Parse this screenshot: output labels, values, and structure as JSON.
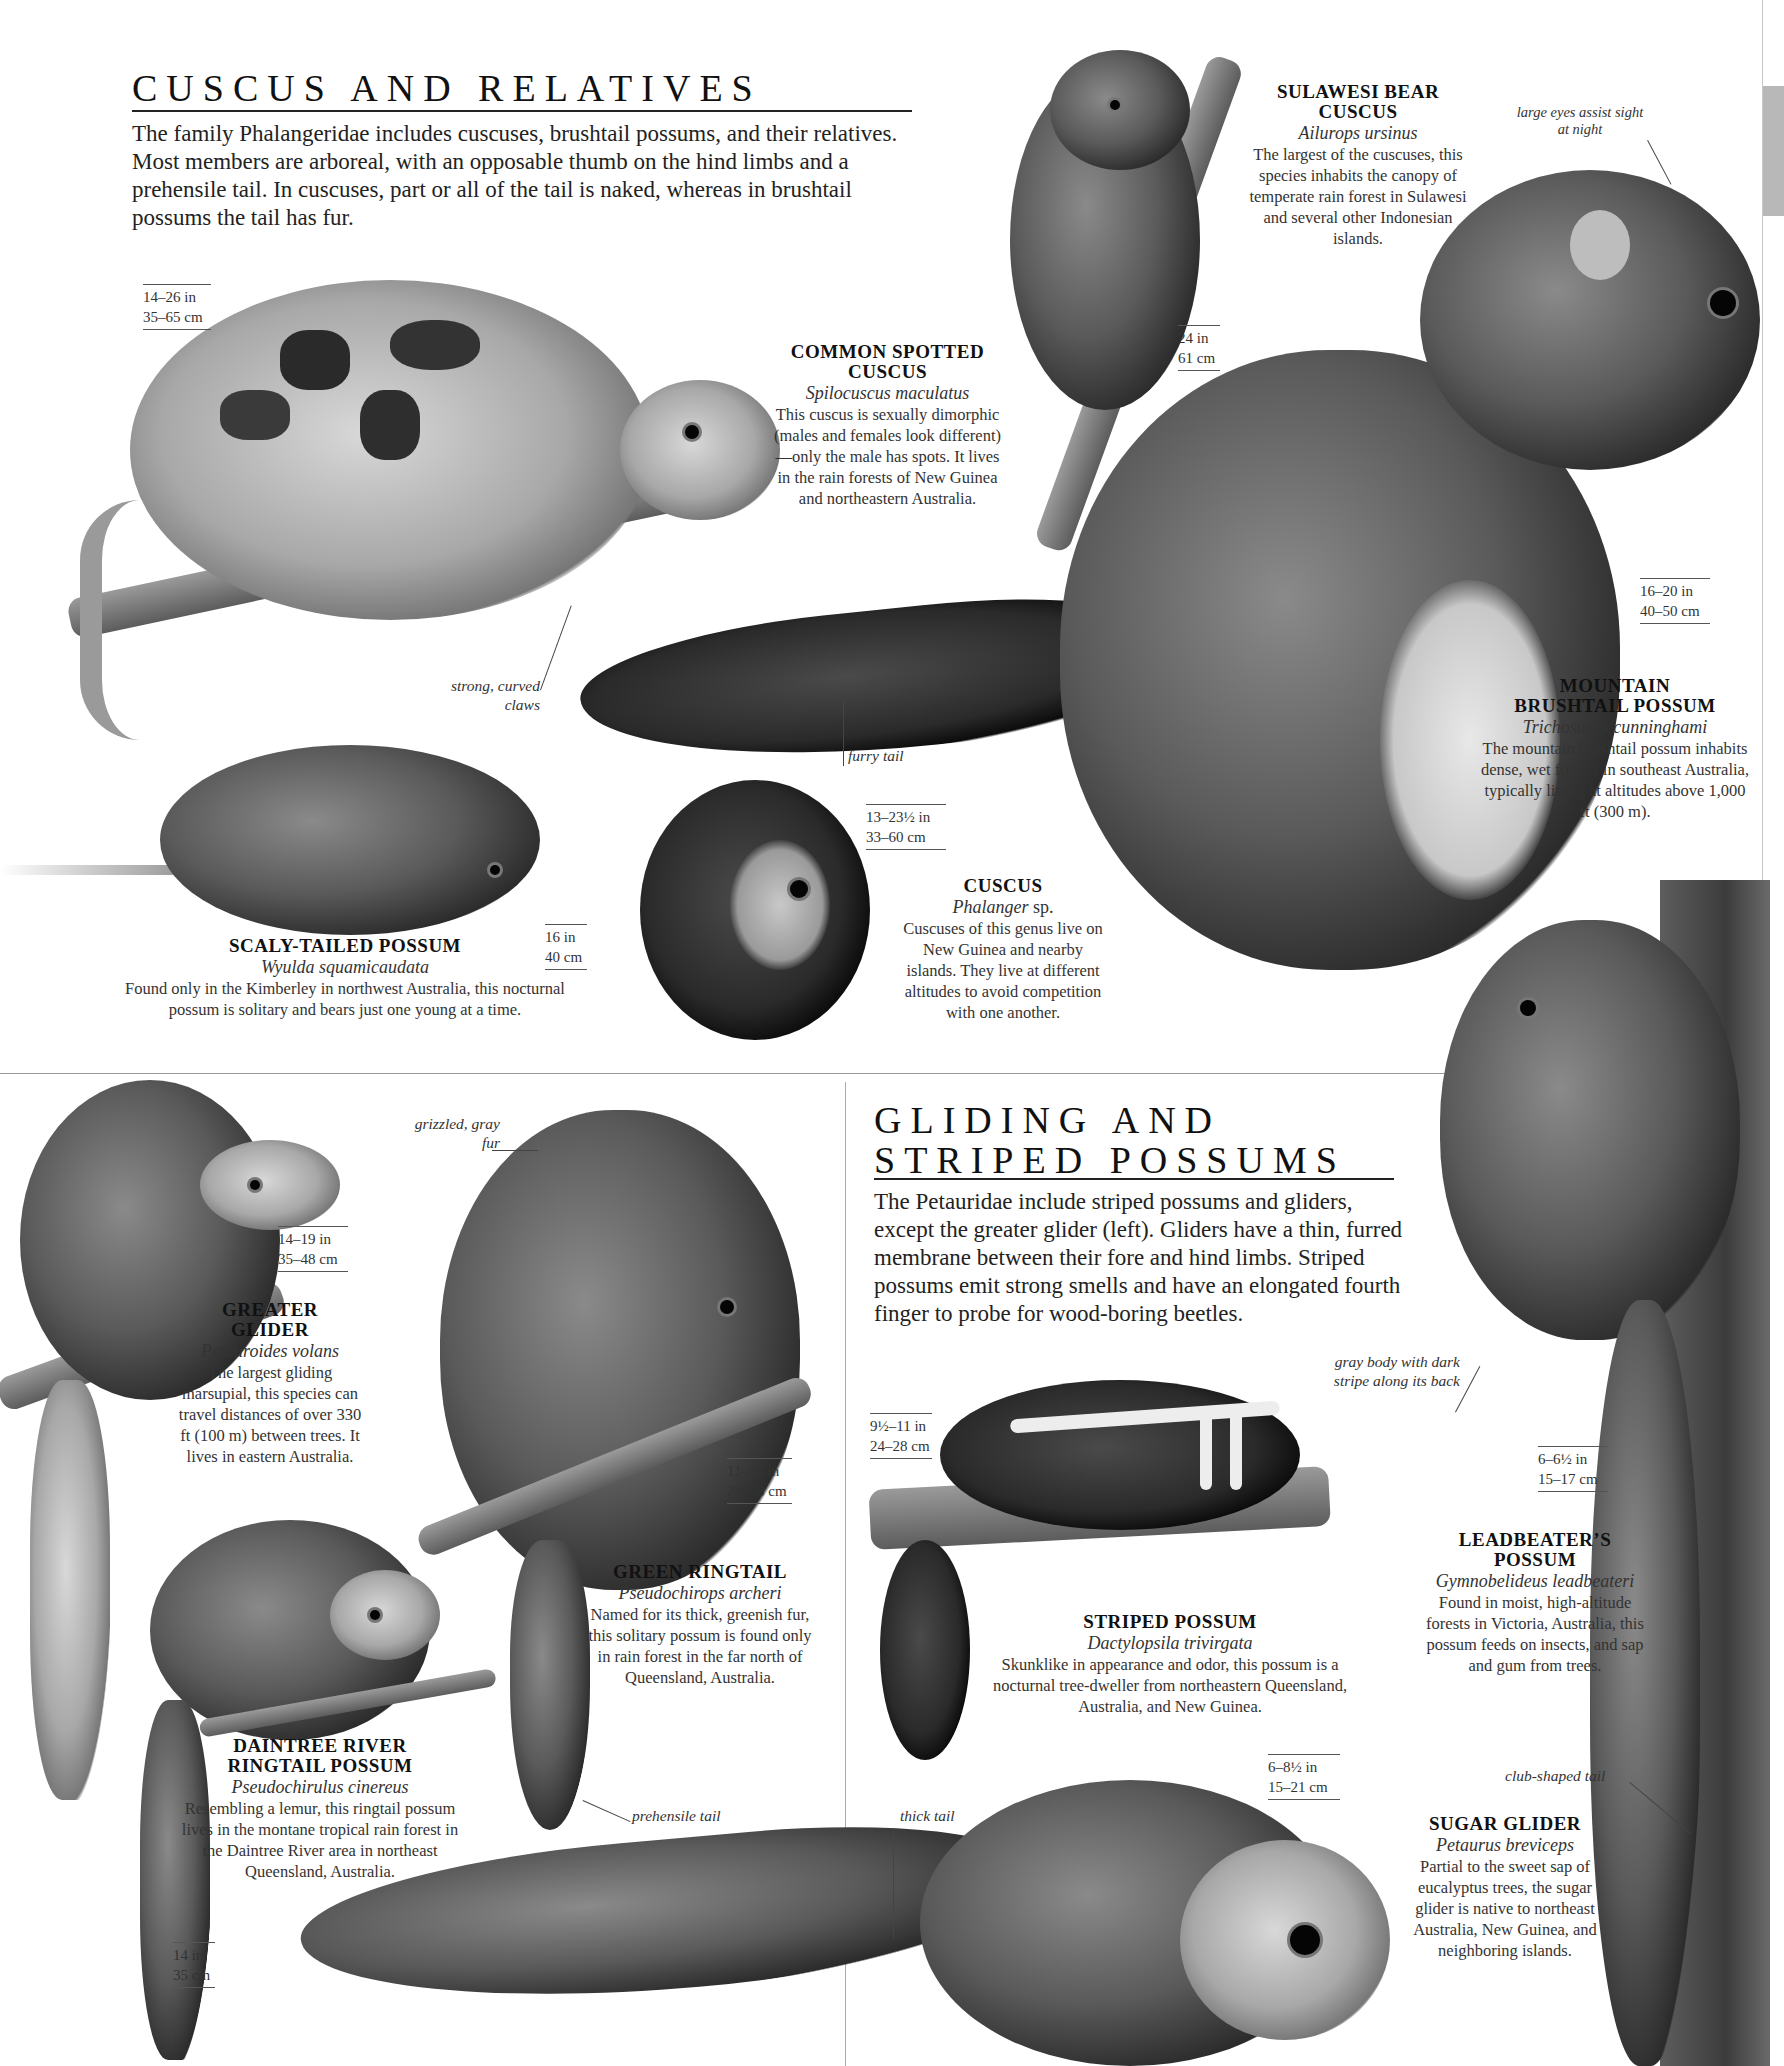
{
  "sections": {
    "cuscus": {
      "title": "CUSCUS AND RELATIVES",
      "intro": "The family Phalangeridae includes cuscuses, brushtail possums, and their relatives. Most members are arboreal, with an opposable thumb on the hind limbs and a prehensile tail. In cuscuses, part or all of the tail is naked, whereas in brushtail possums the tail has fur."
    },
    "gliding": {
      "title_line1": "GLIDING AND",
      "title_line2": "STRIPED POSSUMS",
      "intro": "The Petauridae include striped possums and gliders, except the greater glider (left). Gliders have a thin, furred membrane between their fore and hind limbs. Striped possums emit strong smells and have an elongated fourth finger to probe for wood-boring beetles."
    }
  },
  "species": [
    {
      "id": "sulawesi-bear-cuscus",
      "name_line1": "SULAWESI BEAR",
      "name_line2": "CUSCUS",
      "latin": "Ailurops ursinus",
      "description": "The largest of the cuscuses, this species inhabits the canopy of temperate rain forest in Sulawesi and several other Indonesian islands.",
      "size_in": "24 in",
      "size_cm": "61 cm"
    },
    {
      "id": "common-spotted-cuscus",
      "name_line1": "COMMON SPOTTED",
      "name_line2": "CUSCUS",
      "latin": "Spilocuscus maculatus",
      "description": "This cuscus is sexually dimorphic (males and females look different)—only the male has spots. It lives in the rain forests of New Guinea and northeastern Australia.",
      "size_in": "14–26 in",
      "size_cm": "35–65 cm"
    },
    {
      "id": "mountain-brushtail-possum",
      "name_line1": "MOUNTAIN",
      "name_line2": "BRUSHTAIL POSSUM",
      "latin": "Trichosurus cunninghami",
      "description": "The mountain brushtail possum inhabits dense, wet forests in southeast Australia, typically living at altitudes above 1,000 ft (300 m).",
      "size_in": "16–20 in",
      "size_cm": "40–50 cm"
    },
    {
      "id": "scaly-tailed-possum",
      "name_line1": "SCALY-TAILED POSSUM",
      "latin": "Wyulda squamicaudata",
      "description": "Found only in the Kimberley in northwest Australia, this nocturnal possum is solitary and bears just one young at a time.",
      "size_in": "16 in",
      "size_cm": "40 cm"
    },
    {
      "id": "cuscus",
      "name_line1": "CUSCUS",
      "latin": "Phalanger",
      "latin_suffix": "sp.",
      "description": "Cuscuses of this genus live on New Guinea and nearby islands. They live at different altitudes to avoid competition with one another.",
      "size_in": "13–23½ in",
      "size_cm": "33–60 cm"
    },
    {
      "id": "greater-glider",
      "name_line1": "GREATER",
      "name_line2": "GLIDER",
      "latin": "Petauroides volans",
      "description": "The largest gliding marsupial, this species can travel distances of over 330 ft (100 m) between trees. It lives in eastern Australia.",
      "size_in": "14–19 in",
      "size_cm": "35–48 cm"
    },
    {
      "id": "green-ringtail",
      "name_line1": "GREEN RINGTAIL",
      "latin": "Pseudochirops archeri",
      "description": "Named for its thick, greenish fur, this solitary possum is found only in rain forest in the far north of Queensland, Australia.",
      "size_in": "11–15 in",
      "size_cm": "28–38 cm"
    },
    {
      "id": "daintree-river-ringtail-possum",
      "name_line1": "DAINTREE RIVER",
      "name_line2": "RINGTAIL POSSUM",
      "latin": "Pseudochirulus cinereus",
      "description": "Resembling a lemur, this ringtail possum lives in the montane tropical rain forest in the Daintree River area in northeast Queensland, Australia.",
      "size_in": "14 in",
      "size_cm": "35 cm"
    },
    {
      "id": "striped-possum",
      "name_line1": "STRIPED POSSUM",
      "latin": "Dactylopsila trivirgata",
      "description": "Skunklike in appearance and odor, this possum is a nocturnal tree-dweller from northeastern Queensland, Australia, and New Guinea.",
      "size_in": "9½–11 in",
      "size_cm": "24–28 cm"
    },
    {
      "id": "leadbeaters-possum",
      "name_line1": "LEADBEATER’S",
      "name_line2": "POSSUM",
      "latin": "Gymnobelideus leadbeateri",
      "description": "Found in moist, high-altitude forests in Victoria, Australia, this possum feeds on insects, and sap and gum from trees.",
      "size_in": "6–6½ in",
      "size_cm": "15–17 cm"
    },
    {
      "id": "sugar-glider",
      "name_line1": "SUGAR GLIDER",
      "latin": "Petaurus breviceps",
      "description": "Partial to the sweet sap of eucalyptus trees, the sugar glider is native to northeast Australia, New Guinea, and neighboring islands.",
      "size_in": "6–8½ in",
      "size_cm": "15–21 cm"
    }
  ],
  "annotations": {
    "large_eyes": "large eyes assist sight at night",
    "strong_claws": "strong, curved claws",
    "furry_tail": "furry tail",
    "grizzled_fur": "grizzled, gray fur",
    "gray_body": "gray body with dark stripe along its back",
    "prehensile_tail": "prehensile tail",
    "thick_tail": "thick tail",
    "club_tail": "club-shaped tail"
  }
}
